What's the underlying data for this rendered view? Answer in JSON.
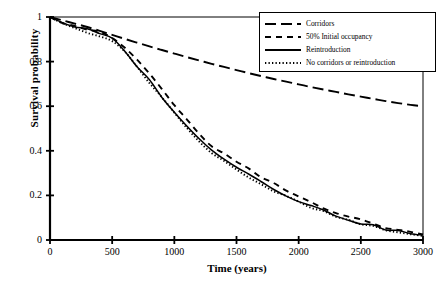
{
  "chart_data": {
    "type": "line",
    "title": "",
    "xlabel": "Time (years)",
    "ylabel": "Survival probability",
    "xlim": [
      0,
      3000
    ],
    "ylim": [
      0,
      1
    ],
    "xticks": [
      0,
      500,
      1000,
      1500,
      2000,
      2500,
      3000
    ],
    "xticklabels": [
      "0",
      "500",
      "1000",
      "1500",
      "2000",
      "2500",
      "3000"
    ],
    "yticks": [
      0,
      0.2,
      0.4,
      0.6,
      0.8,
      1
    ],
    "yticklabels": [
      "0",
      "0.2",
      "0.4",
      "0.6",
      "0.8",
      "1"
    ],
    "grid": false,
    "legend_position": "top-right",
    "legend_entries": [
      "Corridors",
      "50% Initial occupancy",
      "Reintroduction",
      "No corridors or reintroduction"
    ],
    "x": [
      0,
      100,
      200,
      300,
      400,
      500,
      600,
      700,
      800,
      900,
      1000,
      1100,
      1200,
      1300,
      1400,
      1500,
      1600,
      1700,
      1800,
      1900,
      2000,
      2100,
      2200,
      2300,
      2400,
      2500,
      2600,
      2700,
      2800,
      2900,
      3000
    ],
    "series": [
      {
        "name": "Corridors",
        "style": "long-dash",
        "color": "#000000",
        "values": [
          1.0,
          0.985,
          0.97,
          0.955,
          0.938,
          0.92,
          0.902,
          0.885,
          0.868,
          0.852,
          0.836,
          0.82,
          0.805,
          0.79,
          0.776,
          0.762,
          0.748,
          0.735,
          0.722,
          0.71,
          0.698,
          0.686,
          0.675,
          0.664,
          0.653,
          0.643,
          0.633,
          0.623,
          0.614,
          0.606,
          0.6
        ]
      },
      {
        "name": "50% Initial occupancy",
        "style": "dash",
        "color": "#000000",
        "values": [
          1.0,
          0.978,
          0.962,
          0.945,
          0.928,
          0.905,
          0.862,
          0.808,
          0.745,
          0.676,
          0.606,
          0.536,
          0.472,
          0.424,
          0.385,
          0.349,
          0.314,
          0.281,
          0.25,
          0.221,
          0.195,
          0.17,
          0.147,
          0.126,
          0.106,
          0.088,
          0.072,
          0.058,
          0.045,
          0.033,
          0.025
        ]
      },
      {
        "name": "Reintroduction",
        "style": "solid",
        "color": "#000000",
        "values": [
          1.0,
          0.976,
          0.958,
          0.942,
          0.924,
          0.9,
          0.845,
          0.782,
          0.714,
          0.645,
          0.576,
          0.508,
          0.452,
          0.408,
          0.368,
          0.33,
          0.295,
          0.262,
          0.231,
          0.203,
          0.177,
          0.153,
          0.131,
          0.111,
          0.093,
          0.077,
          0.062,
          0.05,
          0.039,
          0.03,
          0.022
        ]
      },
      {
        "name": "No corridors or reintroduction",
        "style": "dot",
        "color": "#000000",
        "values": [
          1.0,
          0.968,
          0.95,
          0.935,
          0.918,
          0.895,
          0.84,
          0.778,
          0.71,
          0.64,
          0.57,
          0.5,
          0.44,
          0.396,
          0.356,
          0.318,
          0.283,
          0.25,
          0.22,
          0.193,
          0.168,
          0.145,
          0.124,
          0.105,
          0.087,
          0.071,
          0.057,
          0.045,
          0.034,
          0.025,
          0.018
        ]
      }
    ]
  },
  "axes": {
    "x_label": "Time (years)",
    "y_label": "Survival probability"
  }
}
